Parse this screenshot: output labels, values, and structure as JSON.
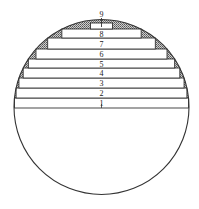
{
  "diagram": {
    "type": "circle-with-stacked-horizontal-slabs",
    "circle": {
      "cx": 101.5,
      "cy": 107,
      "r": 87.5,
      "stroke": "#333333"
    },
    "hatch_color": "#555555",
    "layers": [
      {
        "label": "1",
        "top": 98,
        "bottom": 108
      },
      {
        "label": "2",
        "top": 88,
        "bottom": 98
      },
      {
        "label": "3",
        "top": 78,
        "bottom": 88
      },
      {
        "label": "4",
        "top": 68,
        "bottom": 78
      },
      {
        "label": "5",
        "top": 59,
        "bottom": 68
      },
      {
        "label": "6",
        "top": 49,
        "bottom": 59
      },
      {
        "label": "7",
        "top": 38,
        "bottom": 49
      },
      {
        "label": "8",
        "top": 29,
        "bottom": 38
      },
      {
        "label": "9",
        "top": 23,
        "bottom": 29
      }
    ],
    "top_label": "9"
  }
}
